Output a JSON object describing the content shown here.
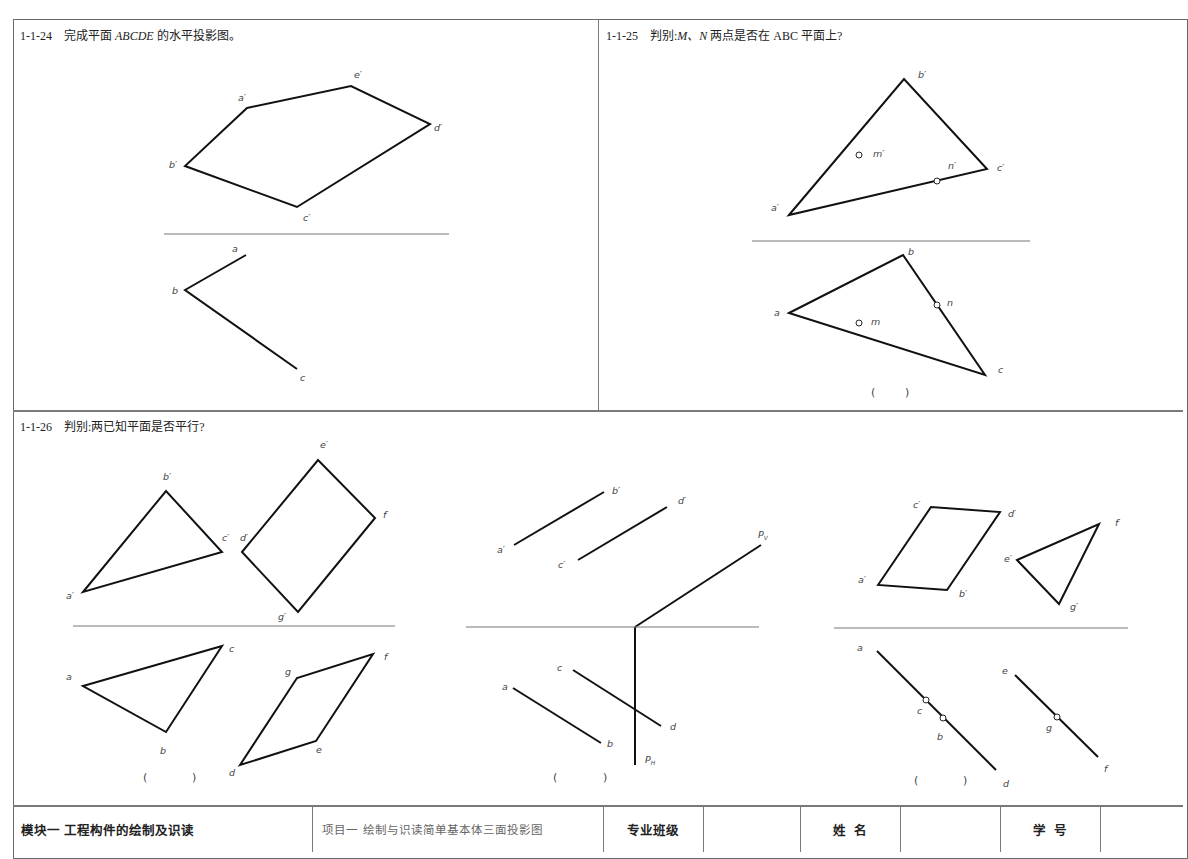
{
  "problems": [
    {
      "id": "1-1-24",
      "number": "1-1-24",
      "prompt_pre": "完成平面 ",
      "prompt_italic": "ABCDE",
      "prompt_post": " 的水平投影图。",
      "front_view": {
        "vertices": [
          {
            "name": "a'",
            "x": 247,
            "y": 108
          },
          {
            "name": "e'",
            "x": 351,
            "y": 86
          },
          {
            "name": "d'",
            "x": 430,
            "y": 124
          },
          {
            "name": "c'",
            "x": 297,
            "y": 207
          },
          {
            "name": "b'",
            "x": 185,
            "y": 166
          }
        ]
      },
      "ground_line": {
        "x1": 164,
        "y1": 234,
        "x2": 449,
        "y2": 234
      },
      "top_view": {
        "polyline": [
          {
            "name": "a",
            "x": 246,
            "y": 255
          },
          {
            "name": "b",
            "x": 185,
            "y": 290
          },
          {
            "name": "c",
            "x": 297,
            "y": 369
          }
        ]
      }
    },
    {
      "id": "1-1-25",
      "number": "1-1-25",
      "prompt_pre": "判别:",
      "prompt_italic": "M、N",
      "prompt_post": " 两点是否在 ABC 平面上?",
      "front_view": {
        "vertices": [
          {
            "name": "a'",
            "x": 789,
            "y": 215
          },
          {
            "name": "b'",
            "x": 904,
            "y": 79
          },
          {
            "name": "c'",
            "x": 987,
            "y": 169
          }
        ],
        "points": [
          {
            "name": "m'",
            "x": 859,
            "y": 155
          },
          {
            "name": "n'",
            "x": 937,
            "y": 181
          }
        ]
      },
      "ground_line": {
        "x1": 752,
        "y1": 241,
        "x2": 1030,
        "y2": 241
      },
      "top_view": {
        "vertices": [
          {
            "name": "a",
            "x": 789,
            "y": 313
          },
          {
            "name": "b",
            "x": 903,
            "y": 255
          },
          {
            "name": "c",
            "x": 985,
            "y": 375
          }
        ],
        "points": [
          {
            "name": "m",
            "x": 859,
            "y": 323
          },
          {
            "name": "n",
            "x": 937,
            "y": 305
          }
        ]
      },
      "answer_blank": "(        )"
    },
    {
      "id": "1-1-26",
      "number": "1-1-26",
      "prompt_pre": "判别:两已知平面是否平行?",
      "prompt_italic": "",
      "prompt_post": "",
      "answer_blanks": [
        "(            )",
        "(            )",
        "(            )"
      ]
    }
  ],
  "footer": {
    "module": "模块一   工程构件的绘制及识读",
    "project": "项目一   绘制与识读简单基本体三面投影图",
    "class_label": "专业班级",
    "class_value": "",
    "name_label": "姓  名",
    "name_value": "",
    "id_label": "学  号",
    "id_value": ""
  }
}
